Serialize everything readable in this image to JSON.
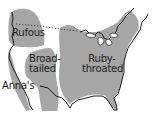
{
  "map": {
    "subject": "Hummingbird ranges in North America",
    "colors": {
      "background": "#ffffff",
      "range_fill": "#a6a6a6",
      "outline": "#1a1a1a",
      "label_text": "#1a1a1a"
    },
    "regions": [
      {
        "id": "rufous",
        "label": "Rufous"
      },
      {
        "id": "broad-tailed",
        "label_line1": "Broad-",
        "label_line2": "tailed"
      },
      {
        "id": "annas",
        "label": "Anna's"
      },
      {
        "id": "ruby-throated",
        "label_line1": "Ruby-",
        "label_line2": "throated"
      }
    ]
  }
}
